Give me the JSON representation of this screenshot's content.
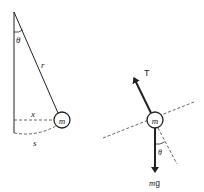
{
  "diagram": {
    "left": {
      "title": "pendulum geometry",
      "labels": {
        "angle": "θ",
        "length": "r",
        "mass": "m",
        "horizontal_displacement": "x",
        "arc_length": "s"
      }
    },
    "right": {
      "title": "free body diagram",
      "labels": {
        "tension": "T",
        "mass": "m",
        "angle": "θ",
        "weight_m": "m",
        "weight_g": "g"
      }
    },
    "colors": {
      "stroke": "#222222",
      "dashed": "#555555",
      "background": "#ffffff"
    }
  }
}
